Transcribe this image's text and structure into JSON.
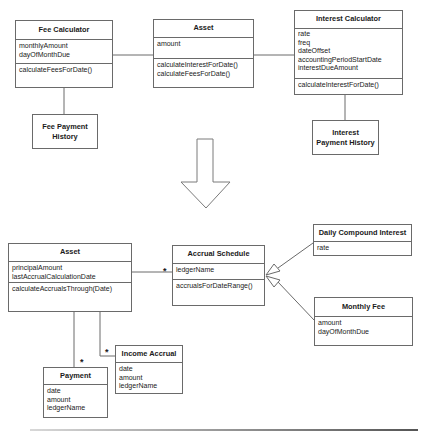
{
  "top": {
    "fee_calculator": {
      "name": "Fee Calculator",
      "attributes": [
        "monthlyAmount",
        "dayOfMonthDue"
      ],
      "operations": [
        "calculateFeesForDate()"
      ]
    },
    "asset": {
      "name": "Asset",
      "attributes": [
        "amount"
      ],
      "operations": [
        "calculateInterestForDate()",
        "calculateFeesForDate()"
      ]
    },
    "interest_calculator": {
      "name": "Interest Calculator",
      "attributes": [
        "rate",
        "freq",
        "dateOffset",
        "accountingPeriodStartDate",
        "interestDueAmount"
      ],
      "operations": [
        "calculateInterestForDate()"
      ]
    },
    "fee_payment_history": {
      "line1": "Fee Payment",
      "line2": "History"
    },
    "interest_payment_history": {
      "line1": "Interest",
      "line2": "Payment History"
    }
  },
  "bottom": {
    "asset": {
      "name": "Asset",
      "attributes": [
        "principalAmount",
        "lastAccrualCalculationDate"
      ],
      "operations": [
        "calculateAccrualsThrough(Date)"
      ]
    },
    "accrual_schedule": {
      "name": "Accrual Schedule",
      "attributes": [
        "ledgerName"
      ],
      "operations": [
        "accrualsForDateRange()"
      ]
    },
    "daily_compound_interest": {
      "name": "Daily Compound Interest",
      "attributes": [
        "rate"
      ]
    },
    "monthly_fee": {
      "name": "Monthly Fee",
      "attributes": [
        "amount",
        "dayOfMonthDue"
      ]
    },
    "payment": {
      "name": "Payment",
      "attributes": [
        "date",
        "amount",
        "ledgerName"
      ]
    },
    "income_accrual": {
      "name": "Income Accrual",
      "attributes": [
        "date",
        "amount",
        "ledgerName"
      ]
    },
    "multiplicity": {
      "asset_to_schedule": "*",
      "asset_to_payment": "*",
      "asset_to_income_accrual": "*"
    }
  }
}
